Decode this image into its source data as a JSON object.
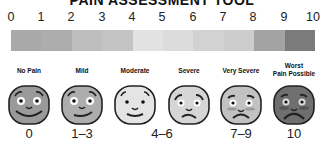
{
  "title": "PAIN ASSESSMENT TOOL",
  "scale": {
    "numbers": [
      "0",
      "1",
      "2",
      "3",
      "4",
      "5",
      "6",
      "7",
      "8",
      "9",
      "10"
    ],
    "segment_colors": [
      "#a9a9a9",
      "#adadad",
      "#bebebe",
      "#c4c4c4",
      "#e2e2e2",
      "#dcdcdc",
      "#d2d2d2",
      "#cdcdcd",
      "#a3a3a3",
      "#7b7b7b"
    ]
  },
  "faces": [
    {
      "label": "No Pain",
      "label2": "",
      "fill": "#9a9a9a",
      "mood": "happy"
    },
    {
      "label": "Mild",
      "label2": "",
      "fill": "#adadad",
      "mood": "smile"
    },
    {
      "label": "Moderate",
      "label2": "",
      "fill": "#e4e4e4",
      "mood": "smile"
    },
    {
      "label": "Severe",
      "label2": "",
      "fill": "#d6d6d6",
      "mood": "worried"
    },
    {
      "label": "Very Severe",
      "label2": "",
      "fill": "#c2c2c2",
      "mood": "sad"
    },
    {
      "label": "Worst",
      "label2": "Pain Possible",
      "fill": "#6f6f6f",
      "mood": "very-sad"
    }
  ],
  "ranges": [
    "0",
    "1–3",
    "4–6",
    "7–9",
    "10"
  ]
}
